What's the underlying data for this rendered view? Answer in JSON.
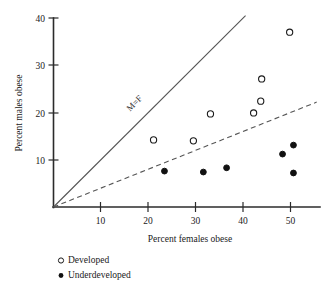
{
  "chart_data": {
    "type": "scatter",
    "title": "",
    "xlabel": "Percent females obese",
    "ylabel": "Percent males obese",
    "xlim": [
      0,
      56
    ],
    "ylim": [
      0,
      42
    ],
    "xticks": [
      10,
      20,
      30,
      40,
      50
    ],
    "yticks": [
      10,
      20,
      30,
      40
    ],
    "grid": false,
    "legend_position": "below-left",
    "series": [
      {
        "name": "Developed",
        "marker": "open-circle",
        "points": [
          {
            "x": 21.1,
            "y": 14.2
          },
          {
            "x": 29.5,
            "y": 14.0
          },
          {
            "x": 33.1,
            "y": 19.7
          },
          {
            "x": 42.2,
            "y": 19.9
          },
          {
            "x": 43.7,
            "y": 22.4
          },
          {
            "x": 43.9,
            "y": 27.1
          },
          {
            "x": 49.8,
            "y": 37.0
          }
        ]
      },
      {
        "name": "Underdeveloped",
        "marker": "filled-circle",
        "points": [
          {
            "x": 23.4,
            "y": 7.6
          },
          {
            "x": 31.6,
            "y": 7.4
          },
          {
            "x": 36.5,
            "y": 8.3
          },
          {
            "x": 48.3,
            "y": 11.2
          },
          {
            "x": 50.6,
            "y": 13.1
          },
          {
            "x": 50.6,
            "y": 7.2
          }
        ]
      }
    ],
    "reference_lines": [
      {
        "name": "equality-line",
        "label": "M=F",
        "style": "solid",
        "slope": 1.0,
        "intercept": 0,
        "x_from": 0,
        "x_to": 40.5
      },
      {
        "name": "trend-line",
        "label": "",
        "style": "dashed",
        "slope": 0.4,
        "intercept": 0,
        "x_from": 0,
        "x_to": 55.5
      }
    ],
    "annotations": [
      {
        "name": "m-equals-f-label",
        "text": "M=F",
        "x": 17.5,
        "y": 21.5,
        "rotation": -45
      }
    ]
  },
  "axes": {
    "x": {
      "title": "Percent females obese",
      "tick_labels": [
        "10",
        "20",
        "30",
        "40",
        "50"
      ]
    },
    "y": {
      "title": "Percent males obese",
      "tick_labels": [
        "10",
        "20",
        "30",
        "40"
      ]
    }
  },
  "legend": {
    "items": [
      {
        "marker": "open-circle",
        "label": "Developed"
      },
      {
        "marker": "filled-circle",
        "label": "Underdeveloped"
      }
    ]
  },
  "colors": {
    "axis": "#2b2b2b",
    "reference_line": "#555555",
    "marker_open_stroke": "#1a1a1a",
    "marker_filled": "#111111",
    "text": "#1a1a1a",
    "background": "#ffffff"
  }
}
